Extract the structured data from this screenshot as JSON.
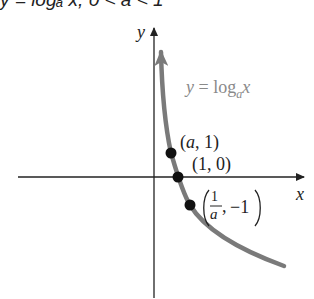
{
  "caption": {
    "text": "y = logₐ x, 0 < a < 1"
  },
  "axes": {
    "x_label": "x",
    "y_label": "y",
    "axis_color": "#222222"
  },
  "curve": {
    "label_prefix": "y = log",
    "label_sub": "a",
    "label_suffix": "x",
    "color": "#7a7a7a",
    "label_color": "#8a8a8a"
  },
  "points": [
    {
      "label": "(a, 1)",
      "x_text": "a",
      "y_text": "1"
    },
    {
      "label": "(1, 0)",
      "x_text": "1",
      "y_text": "0"
    },
    {
      "label": "(1/a, -1)",
      "frac_num": "1",
      "frac_den": "a",
      "y_text": "−1"
    }
  ]
}
